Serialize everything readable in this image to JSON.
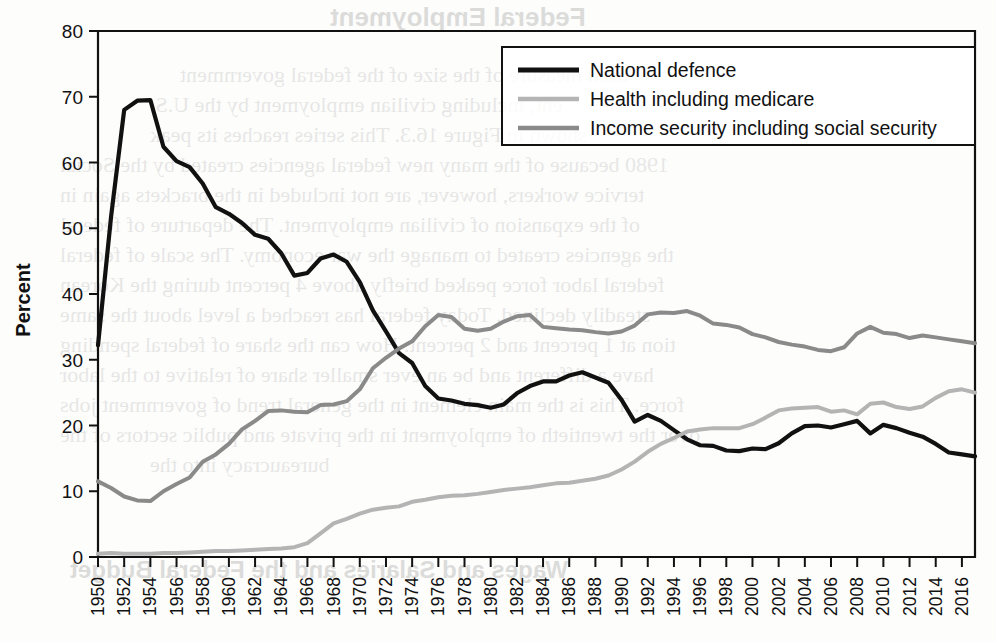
{
  "chart_data": {
    "type": "line",
    "title": "",
    "xlabel": "",
    "ylabel": "Percent",
    "ylim": [
      0,
      80
    ],
    "xlim": [
      1950,
      2017
    ],
    "ytick_step": 10,
    "yticks": [
      0,
      10,
      20,
      30,
      40,
      50,
      60,
      70,
      80
    ],
    "grid": false,
    "legend_position": "top-right",
    "categories": [
      1950,
      1951,
      1952,
      1953,
      1954,
      1955,
      1956,
      1957,
      1958,
      1959,
      1960,
      1961,
      1962,
      1963,
      1964,
      1965,
      1966,
      1967,
      1968,
      1969,
      1970,
      1971,
      1972,
      1973,
      1974,
      1975,
      1976,
      1977,
      1978,
      1979,
      1980,
      1981,
      1982,
      1983,
      1984,
      1985,
      1986,
      1987,
      1988,
      1989,
      1990,
      1991,
      1992,
      1993,
      1994,
      1995,
      1996,
      1997,
      1998,
      1999,
      2000,
      2001,
      2002,
      2003,
      2004,
      2005,
      2006,
      2007,
      2008,
      2009,
      2010,
      2011,
      2012,
      2013,
      2014,
      2015,
      2016,
      2017
    ],
    "xtick_labels": [
      "1950",
      "1952",
      "1954",
      "1956",
      "1958",
      "1960",
      "1962",
      "1964",
      "1966",
      "1968",
      "1970",
      "1972",
      "1974",
      "1976",
      "1978",
      "1980",
      "1982",
      "1984",
      "1986",
      "1988",
      "1990",
      "1992",
      "1994",
      "1996",
      "1998",
      "2000",
      "2002",
      "2004",
      "2006",
      "2008",
      "2010",
      "2012",
      "2014",
      "2016"
    ],
    "series": [
      {
        "name": "National defence",
        "color": "#111111",
        "width": 4.2,
        "values": [
          32.2,
          51.8,
          68.0,
          69.4,
          69.5,
          62.4,
          60.2,
          59.3,
          56.8,
          53.2,
          52.2,
          50.8,
          49.0,
          48.4,
          46.2,
          42.8,
          43.2,
          45.4,
          46.0,
          44.9,
          41.8,
          37.5,
          34.3,
          31.0,
          29.5,
          26.0,
          24.1,
          23.8,
          23.3,
          23.1,
          22.7,
          23.2,
          24.9,
          26.0,
          26.7,
          26.7,
          27.6,
          28.1,
          27.3,
          26.5,
          23.9,
          20.6,
          21.6,
          20.7,
          19.3,
          17.9,
          17.0,
          16.9,
          16.2,
          16.1,
          16.5,
          16.4,
          17.3,
          18.8,
          19.9,
          20.0,
          19.7,
          20.2,
          20.7,
          18.8,
          20.1,
          19.6,
          18.9,
          18.3,
          17.2,
          15.9,
          15.6,
          15.3
        ]
      },
      {
        "name": "Health including medicare",
        "color": "#b4b4b4",
        "width": 4.0,
        "values": [
          0.5,
          0.6,
          0.5,
          0.5,
          0.5,
          0.6,
          0.6,
          0.7,
          0.8,
          0.9,
          0.9,
          1.0,
          1.1,
          1.2,
          1.3,
          1.5,
          2.1,
          3.6,
          5.1,
          5.8,
          6.6,
          7.2,
          7.5,
          7.7,
          8.4,
          8.7,
          9.1,
          9.3,
          9.4,
          9.6,
          9.9,
          10.2,
          10.4,
          10.6,
          10.9,
          11.2,
          11.3,
          11.6,
          11.9,
          12.4,
          13.3,
          14.5,
          16.0,
          17.2,
          18.1,
          19.1,
          19.4,
          19.6,
          19.6,
          19.6,
          20.2,
          21.2,
          22.3,
          22.6,
          22.7,
          22.8,
          22.1,
          22.3,
          21.7,
          23.3,
          23.5,
          22.8,
          22.5,
          22.9,
          24.2,
          25.2,
          25.5,
          25.0
        ]
      },
      {
        "name": "Income security including social security",
        "color": "#8a8a8a",
        "width": 4.0,
        "values": [
          11.5,
          10.5,
          9.2,
          8.6,
          8.5,
          10.0,
          11.1,
          12.1,
          14.5,
          15.6,
          17.2,
          19.4,
          20.7,
          22.2,
          22.3,
          22.1,
          22.0,
          23.1,
          23.2,
          23.7,
          25.5,
          28.7,
          30.3,
          31.7,
          32.8,
          35.1,
          36.8,
          36.5,
          34.7,
          34.4,
          34.7,
          35.8,
          36.6,
          36.8,
          35.0,
          34.8,
          34.6,
          34.5,
          34.2,
          34.0,
          34.3,
          35.2,
          36.9,
          37.2,
          37.1,
          37.4,
          36.7,
          35.5,
          35.3,
          34.9,
          33.9,
          33.4,
          32.7,
          32.3,
          32.0,
          31.5,
          31.3,
          31.9,
          34.0,
          35.0,
          34.1,
          33.9,
          33.3,
          33.7,
          33.4,
          33.1,
          32.8,
          32.5
        ]
      }
    ]
  },
  "legend": {
    "items": [
      {
        "label": "National defence"
      },
      {
        "label": "Health including medicare"
      },
      {
        "label": "Income security including social security"
      }
    ]
  },
  "background_bleed": {
    "heading_top": "Federal Employment",
    "heading_bottom": "Wages and Salaries and the Federal Budget",
    "lines": [
      "used measure of the size of the federal government",
      "ent, including civilian employment by the U.S.",
      "shown in Figure 16.3. This series reaches its peak",
      "1980 because of the many new federal agencies created by the Social",
      "tervice workers, however, are not included in the brackets again in",
      "of the expansion of civilian employment. The departure of federal",
      "the agencies created to manage the war economy. The scale of federal",
      "federal labor force peaked briefly above 4 percent during the Korean",
      "steadily declined. Today federal has reached a level about the same",
      "tion at 1 percent and 2 percent. How can the share of federal spending",
      "have a different and be an ever smaller share of relative to the labor",
      "force. This is the main element in the general trend of government jobs",
      "over the twentieth of employment in the private and public sectors of the",
      "bureaucracy into the"
    ]
  }
}
